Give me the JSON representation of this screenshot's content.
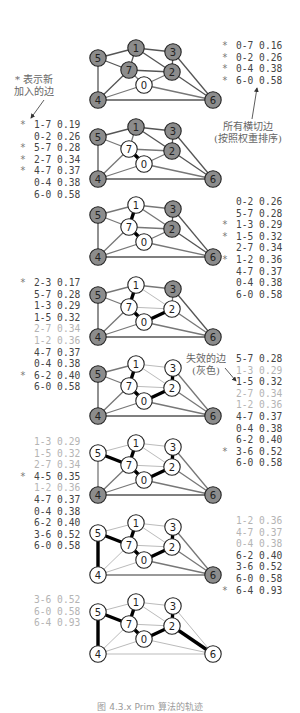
{
  "annotations": {
    "star_legend": [
      "* 表示新",
      "加入的边"
    ],
    "crossing_edges": [
      "所有横切边",
      "(按照权重排序)"
    ],
    "ineligible_edges": [
      "失效的边",
      "(灰色)"
    ]
  },
  "caption": "图 4.3.x  Prim 算法的轨迹",
  "colors": {
    "tree_node": "#ffffff",
    "non_tree_node": "#8c8c8c",
    "mst_edge": "#000000",
    "graph_edge": "#555555",
    "ineligible_edge": "#bbbbbb",
    "crossing_edge": "#777777",
    "text": "#444444",
    "inactive_text": "#b4b4b4"
  },
  "nodes": {
    "0": [
      144,
      85
    ],
    "1": [
      136,
      48
    ],
    "2": [
      172,
      72
    ],
    "3": [
      173,
      52
    ],
    "4": [
      98,
      100
    ],
    "5": [
      98,
      58
    ],
    "6": [
      213,
      100
    ],
    "7": [
      129,
      70
    ]
  },
  "edges": [
    [
      "4",
      "5"
    ],
    [
      "4",
      "7"
    ],
    [
      "5",
      "7"
    ],
    [
      "0",
      "7"
    ],
    [
      "1",
      "5"
    ],
    [
      "0",
      "4"
    ],
    [
      "2",
      "3"
    ],
    [
      "1",
      "7"
    ],
    [
      "0",
      "2"
    ],
    [
      "1",
      "2"
    ],
    [
      "1",
      "3"
    ],
    [
      "2",
      "7"
    ],
    [
      "6",
      "2"
    ],
    [
      "3",
      "6"
    ],
    [
      "6",
      "0"
    ],
    [
      "6",
      "4"
    ]
  ],
  "steps": [
    {
      "dy": 0,
      "tree": [
        "0"
      ],
      "mst": [],
      "ineligible": [],
      "list_side": "right",
      "list_pos": [
        222,
        40
      ],
      "list": [
        {
          "mark": "*",
          "edge": "0-7",
          "weight": "0.16",
          "active": true
        },
        {
          "mark": "*",
          "edge": "0-2",
          "weight": "0.26",
          "active": true
        },
        {
          "mark": "*",
          "edge": "0-4",
          "weight": "0.38",
          "active": true
        },
        {
          "mark": "*",
          "edge": "6-0",
          "weight": "0.58",
          "active": true
        }
      ]
    },
    {
      "dy": 0,
      "tree": [
        "0",
        "7"
      ],
      "mst": [
        [
          "0",
          "7"
        ]
      ],
      "ineligible": [],
      "list_side": "left",
      "list_pos": [
        20,
        119
      ],
      "list": [
        {
          "mark": "*",
          "edge": "1-7",
          "weight": "0.19",
          "active": true
        },
        {
          "mark": "",
          "edge": "0-2",
          "weight": "0.26",
          "active": true
        },
        {
          "mark": "*",
          "edge": "5-7",
          "weight": "0.28",
          "active": true
        },
        {
          "mark": "*",
          "edge": "2-7",
          "weight": "0.34",
          "active": true
        },
        {
          "mark": "*",
          "edge": "4-7",
          "weight": "0.37",
          "active": true
        },
        {
          "mark": "",
          "edge": "0-4",
          "weight": "0.38",
          "active": true
        },
        {
          "mark": "",
          "edge": "6-0",
          "weight": "0.58",
          "active": true
        }
      ]
    },
    {
      "dy": 0,
      "tree": [
        "0",
        "7",
        "1"
      ],
      "mst": [
        [
          "0",
          "7"
        ],
        [
          "1",
          "7"
        ]
      ],
      "ineligible": [],
      "list_side": "right",
      "list_pos": [
        222,
        196
      ],
      "list": [
        {
          "mark": "",
          "edge": "0-2",
          "weight": "0.26",
          "active": true
        },
        {
          "mark": "",
          "edge": "5-7",
          "weight": "0.28",
          "active": true
        },
        {
          "mark": "*",
          "edge": "1-3",
          "weight": "0.29",
          "active": true
        },
        {
          "mark": "*",
          "edge": "1-5",
          "weight": "0.32",
          "active": true
        },
        {
          "mark": "",
          "edge": "2-7",
          "weight": "0.34",
          "active": true
        },
        {
          "mark": "*",
          "edge": "1-2",
          "weight": "0.36",
          "active": true
        },
        {
          "mark": "",
          "edge": "4-7",
          "weight": "0.37",
          "active": true
        },
        {
          "mark": "",
          "edge": "0-4",
          "weight": "0.38",
          "active": true
        },
        {
          "mark": "",
          "edge": "6-0",
          "weight": "0.58",
          "active": true
        }
      ]
    },
    {
      "dy": 0,
      "tree": [
        "0",
        "7",
        "1",
        "2"
      ],
      "mst": [
        [
          "0",
          "7"
        ],
        [
          "1",
          "7"
        ],
        [
          "0",
          "2"
        ]
      ],
      "ineligible": [
        [
          "2",
          "7"
        ],
        [
          "1",
          "2"
        ]
      ],
      "list_side": "left",
      "list_pos": [
        20,
        277
      ],
      "list": [
        {
          "mark": "*",
          "edge": "2-3",
          "weight": "0.17",
          "active": true
        },
        {
          "mark": "",
          "edge": "5-7",
          "weight": "0.28",
          "active": true
        },
        {
          "mark": "",
          "edge": "1-3",
          "weight": "0.29",
          "active": true
        },
        {
          "mark": "",
          "edge": "1-5",
          "weight": "0.32",
          "active": true
        },
        {
          "mark": "",
          "edge": "2-7",
          "weight": "0.34",
          "active": false
        },
        {
          "mark": "",
          "edge": "1-2",
          "weight": "0.36",
          "active": false
        },
        {
          "mark": "",
          "edge": "4-7",
          "weight": "0.37",
          "active": true
        },
        {
          "mark": "",
          "edge": "0-4",
          "weight": "0.38",
          "active": true
        },
        {
          "mark": "*",
          "edge": "6-2",
          "weight": "0.40",
          "active": true
        },
        {
          "mark": "",
          "edge": "6-0",
          "weight": "0.58",
          "active": true
        }
      ]
    },
    {
      "dy": 0,
      "tree": [
        "0",
        "7",
        "1",
        "2",
        "3"
      ],
      "mst": [
        [
          "0",
          "7"
        ],
        [
          "1",
          "7"
        ],
        [
          "0",
          "2"
        ],
        [
          "2",
          "3"
        ]
      ],
      "ineligible": [
        [
          "2",
          "7"
        ],
        [
          "1",
          "2"
        ],
        [
          "1",
          "3"
        ]
      ],
      "list_side": "right",
      "list_pos": [
        222,
        353
      ],
      "list": [
        {
          "mark": "",
          "edge": "5-7",
          "weight": "0.28",
          "active": true
        },
        {
          "mark": "",
          "edge": "1-3",
          "weight": "0.29",
          "active": false
        },
        {
          "mark": "",
          "edge": "1-5",
          "weight": "0.32",
          "active": true
        },
        {
          "mark": "",
          "edge": "2-7",
          "weight": "0.34",
          "active": false
        },
        {
          "mark": "",
          "edge": "1-2",
          "weight": "0.36",
          "active": false
        },
        {
          "mark": "",
          "edge": "4-7",
          "weight": "0.37",
          "active": true
        },
        {
          "mark": "",
          "edge": "0-4",
          "weight": "0.38",
          "active": true
        },
        {
          "mark": "",
          "edge": "6-2",
          "weight": "0.40",
          "active": true
        },
        {
          "mark": "*",
          "edge": "3-6",
          "weight": "0.52",
          "active": true
        },
        {
          "mark": "",
          "edge": "6-0",
          "weight": "0.58",
          "active": true
        }
      ]
    },
    {
      "dy": 0,
      "tree": [
        "0",
        "7",
        "1",
        "2",
        "3",
        "5"
      ],
      "mst": [
        [
          "0",
          "7"
        ],
        [
          "1",
          "7"
        ],
        [
          "0",
          "2"
        ],
        [
          "2",
          "3"
        ],
        [
          "5",
          "7"
        ]
      ],
      "ineligible": [
        [
          "2",
          "7"
        ],
        [
          "1",
          "2"
        ],
        [
          "1",
          "3"
        ],
        [
          "1",
          "5"
        ]
      ],
      "list_side": "left",
      "list_pos": [
        20,
        436
      ],
      "list": [
        {
          "mark": "",
          "edge": "1-3",
          "weight": "0.29",
          "active": false
        },
        {
          "mark": "",
          "edge": "1-5",
          "weight": "0.32",
          "active": false
        },
        {
          "mark": "",
          "edge": "2-7",
          "weight": "0.34",
          "active": false
        },
        {
          "mark": "*",
          "edge": "4-5",
          "weight": "0.35",
          "active": true
        },
        {
          "mark": "",
          "edge": "1-2",
          "weight": "0.36",
          "active": false
        },
        {
          "mark": "",
          "edge": "4-7",
          "weight": "0.37",
          "active": true
        },
        {
          "mark": "",
          "edge": "0-4",
          "weight": "0.38",
          "active": true
        },
        {
          "mark": "",
          "edge": "6-2",
          "weight": "0.40",
          "active": true
        },
        {
          "mark": "",
          "edge": "3-6",
          "weight": "0.52",
          "active": true
        },
        {
          "mark": "",
          "edge": "6-0",
          "weight": "0.58",
          "active": true
        }
      ]
    },
    {
      "dy": 0,
      "tree": [
        "0",
        "7",
        "1",
        "2",
        "3",
        "5",
        "4"
      ],
      "mst": [
        [
          "0",
          "7"
        ],
        [
          "1",
          "7"
        ],
        [
          "0",
          "2"
        ],
        [
          "2",
          "3"
        ],
        [
          "5",
          "7"
        ],
        [
          "4",
          "5"
        ]
      ],
      "ineligible": [
        [
          "2",
          "7"
        ],
        [
          "1",
          "2"
        ],
        [
          "1",
          "3"
        ],
        [
          "1",
          "5"
        ],
        [
          "4",
          "7"
        ],
        [
          "0",
          "4"
        ]
      ],
      "list_side": "right",
      "list_pos": [
        222,
        515
      ],
      "list": [
        {
          "mark": "",
          "edge": "1-2",
          "weight": "0.36",
          "active": false
        },
        {
          "mark": "",
          "edge": "4-7",
          "weight": "0.37",
          "active": false
        },
        {
          "mark": "",
          "edge": "0-4",
          "weight": "0.38",
          "active": false
        },
        {
          "mark": "",
          "edge": "6-2",
          "weight": "0.40",
          "active": true
        },
        {
          "mark": "",
          "edge": "3-6",
          "weight": "0.52",
          "active": true
        },
        {
          "mark": "",
          "edge": "6-0",
          "weight": "0.58",
          "active": true
        },
        {
          "mark": "*",
          "edge": "6-4",
          "weight": "0.93",
          "active": true
        }
      ]
    },
    {
      "dy": 0,
      "tree": [
        "0",
        "7",
        "1",
        "2",
        "3",
        "5",
        "4",
        "6"
      ],
      "mst": [
        [
          "0",
          "7"
        ],
        [
          "1",
          "7"
        ],
        [
          "0",
          "2"
        ],
        [
          "2",
          "3"
        ],
        [
          "5",
          "7"
        ],
        [
          "4",
          "5"
        ],
        [
          "6",
          "2"
        ]
      ],
      "ineligible": [
        [
          "2",
          "7"
        ],
        [
          "1",
          "2"
        ],
        [
          "1",
          "3"
        ],
        [
          "1",
          "5"
        ],
        [
          "4",
          "7"
        ],
        [
          "0",
          "4"
        ],
        [
          "3",
          "6"
        ],
        [
          "6",
          "0"
        ],
        [
          "6",
          "4"
        ]
      ],
      "list_side": "left",
      "list_pos": [
        20,
        594
      ],
      "list": [
        {
          "mark": "",
          "edge": "3-6",
          "weight": "0.52",
          "active": false
        },
        {
          "mark": "",
          "edge": "6-0",
          "weight": "0.58",
          "active": false
        },
        {
          "mark": "",
          "edge": "6-4",
          "weight": "0.93",
          "active": false
        }
      ]
    }
  ],
  "step_offsets": [
    0,
    79,
    157,
    237,
    316,
    395,
    475,
    554
  ],
  "crossing_hint_edges": [
    [
      [
        "0",
        "2"
      ],
      [
        "0",
        "4"
      ],
      [
        "6",
        "0"
      ]
    ]
  ]
}
